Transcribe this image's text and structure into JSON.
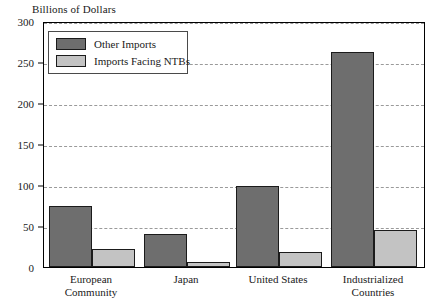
{
  "chart_data": {
    "type": "bar",
    "title": "",
    "ylabel": "Billions of Dollars",
    "xlabel": "",
    "ylim": [
      0,
      300
    ],
    "yticks": [
      0,
      50,
      100,
      150,
      200,
      250,
      300
    ],
    "ytick_labels": [
      "0",
      "50",
      "100",
      "150",
      "200",
      "250",
      "300"
    ],
    "grid": true,
    "legend_position": "upper-left",
    "categories": [
      "European Community",
      "Japan",
      "United States",
      "Industrialized Countries"
    ],
    "category_label_lines": [
      [
        "European",
        "Community"
      ],
      [
        "Japan",
        ""
      ],
      [
        "United States",
        ""
      ],
      [
        "Industrialized",
        "Countries"
      ]
    ],
    "series": [
      {
        "name": "Other Imports",
        "color": "#6e6e6e",
        "values": [
          74,
          40,
          99,
          262
        ]
      },
      {
        "name": "Imports Facing NTBs",
        "color": "#c3c3c3",
        "values": [
          22,
          6,
          18,
          45
        ]
      }
    ]
  },
  "legend": {
    "items": [
      {
        "label": "Other Imports",
        "swatch": "dark"
      },
      {
        "label": "Imports Facing NTBs",
        "swatch": "light"
      }
    ]
  },
  "colors": {
    "dark_bar": "#6e6e6e",
    "light_bar": "#c3c3c3",
    "outline": "#1b1b1b",
    "gridline": "#9a9a9a",
    "background": "#ffffff"
  }
}
